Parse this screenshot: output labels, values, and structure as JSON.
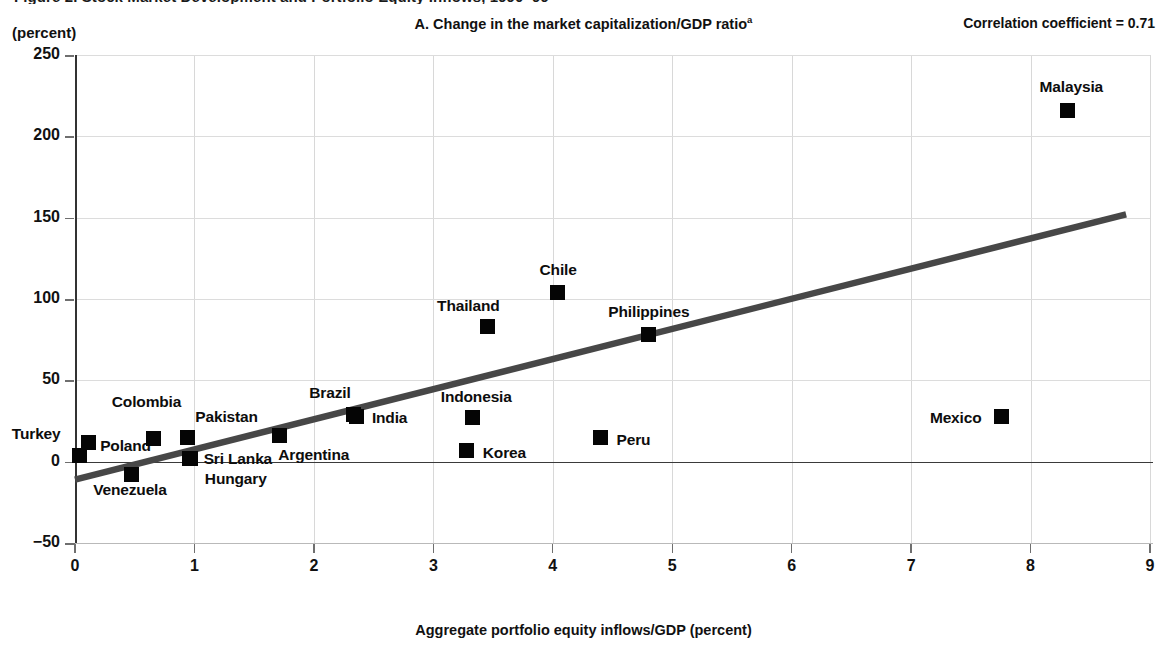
{
  "figure": {
    "cut_caption": "Figure 2. Stock Market Development and Portfolio Equity Inflows, 1990–99",
    "unit_label": "(percent)",
    "panel_title": "A. Change in the market capitalization/GDP ratio",
    "panel_title_superscript": "a",
    "correlation_label": "Correlation coefficient = 0.71"
  },
  "chart_data": {
    "type": "scatter",
    "title": "A. Change in the market capitalization/GDP ratio",
    "xlabel": "Aggregate portfolio equity inflows/GDP (percent)",
    "ylabel": "(percent)",
    "xlim": [
      0,
      9
    ],
    "ylim": [
      -50,
      250
    ],
    "xticks": [
      0,
      1,
      2,
      3,
      4,
      5,
      6,
      7,
      8,
      9
    ],
    "yticks": [
      -50,
      0,
      50,
      100,
      150,
      200,
      250
    ],
    "ytick_labels": [
      "−50",
      "0",
      "50",
      "100",
      "150",
      "200",
      "250"
    ],
    "xtick_labels": [
      "0",
      "1",
      "2",
      "3",
      "4",
      "5",
      "6",
      "7",
      "8",
      "9"
    ],
    "grid": true,
    "legend": "none",
    "annotations": [
      "Correlation coefficient = 0.71"
    ],
    "correlation_coefficient": 0.71,
    "marker_color": "#050505",
    "trendline_color": "#474747",
    "grid_color": "#d8d8d8",
    "trendline": {
      "x0": 0.0,
      "y0": -11,
      "x1": 8.8,
      "y1": 152
    },
    "points": [
      {
        "name": "Turkey",
        "x": 0.04,
        "y": 4,
        "label_dx": -68,
        "label_dy": -22
      },
      {
        "name": "Poland",
        "x": 0.11,
        "y": 12,
        "label_dx": 12,
        "label_dy": 3
      },
      {
        "name": "Venezuela",
        "x": 0.47,
        "y": -8,
        "label_dx": -38,
        "label_dy": 14
      },
      {
        "name": "Colombia",
        "x": 0.66,
        "y": 14,
        "label_dx": -42,
        "label_dy": -38
      },
      {
        "name": "Pakistan",
        "x": 0.94,
        "y": 15,
        "label_dx": 8,
        "label_dy": -21
      },
      {
        "name": "Sri Lanka",
        "x": 0.96,
        "y": 2,
        "label_dx": 14,
        "label_dy": 0
      },
      {
        "name": "Hungary",
        "x": 0.97,
        "y": 2,
        "label_dx": 14,
        "label_dy": 20
      },
      {
        "name": "Argentina",
        "x": 1.71,
        "y": 16,
        "label_dx": -1,
        "label_dy": 18
      },
      {
        "name": "Brazil",
        "x": 2.33,
        "y": 29,
        "label_dx": -44,
        "label_dy": -22
      },
      {
        "name": "India",
        "x": 2.36,
        "y": 28,
        "label_dx": 15,
        "label_dy": 1
      },
      {
        "name": "Korea",
        "x": 3.28,
        "y": 7,
        "label_dx": 16,
        "label_dy": 2
      },
      {
        "name": "Indonesia",
        "x": 3.33,
        "y": 27,
        "label_dx": -32,
        "label_dy": -22
      },
      {
        "name": "Thailand",
        "x": 3.45,
        "y": 83,
        "label_dx": -50,
        "label_dy": -22
      },
      {
        "name": "Chile",
        "x": 4.04,
        "y": 104,
        "label_dx": -18,
        "label_dy": -23
      },
      {
        "name": "Peru",
        "x": 4.4,
        "y": 15,
        "label_dx": 16,
        "label_dy": 2
      },
      {
        "name": "Philippines",
        "x": 4.8,
        "y": 78,
        "label_dx": -40,
        "label_dy": -24
      },
      {
        "name": "Mexico",
        "x": 7.76,
        "y": 28,
        "label_dx": -72,
        "label_dy": 1
      },
      {
        "name": "Malaysia",
        "x": 8.31,
        "y": 216,
        "label_dx": -28,
        "label_dy": -24
      }
    ]
  },
  "axis": {
    "x_title": "Aggregate portfolio equity inflows/GDP (percent)"
  }
}
